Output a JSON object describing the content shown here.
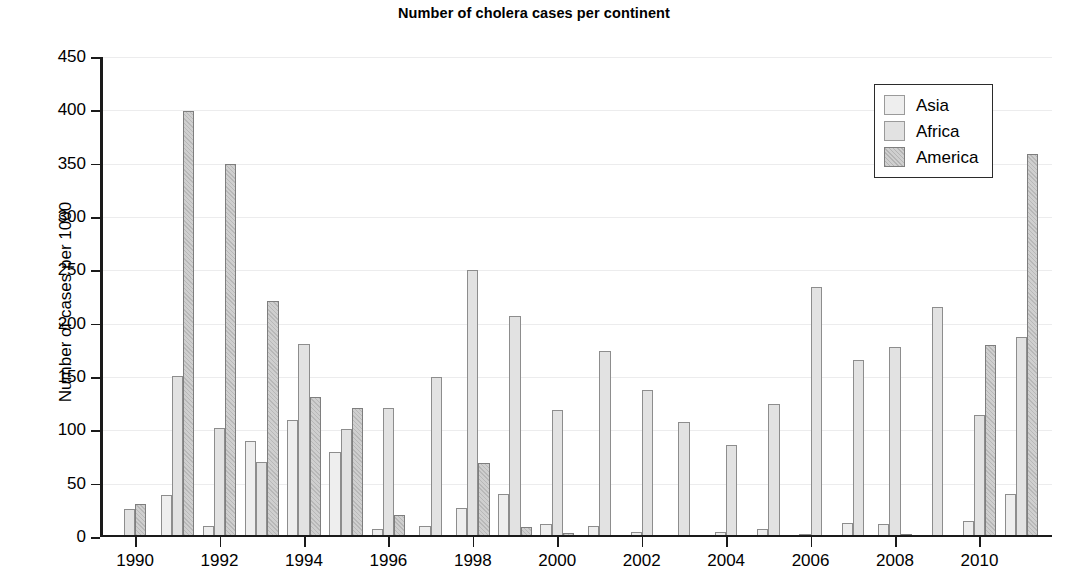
{
  "chart_data": {
    "type": "bar",
    "title": "Number of cholera cases per continent",
    "xlabel": "",
    "ylabel": "Number of cases per 1000",
    "ylim": [
      0,
      450
    ],
    "ytick_step": 50,
    "yticks": [
      0,
      50,
      100,
      150,
      200,
      250,
      300,
      350,
      400,
      450
    ],
    "xticks": [
      1990,
      1992,
      1994,
      1996,
      1998,
      2000,
      2002,
      2004,
      2006,
      2008,
      2010
    ],
    "x_range": [
      1990,
      2011
    ],
    "grid": true,
    "legend_position": "top-right",
    "categories": [
      1990,
      1991,
      1992,
      1993,
      1994,
      1995,
      1996,
      1997,
      1998,
      1999,
      2000,
      2001,
      2002,
      2003,
      2004,
      2005,
      2006,
      2007,
      2008,
      2009,
      2010,
      2011
    ],
    "series": [
      {
        "name": "Asia",
        "color": "#eeeeee",
        "values": [
          0,
          38,
          9,
          89,
          109,
          79,
          7,
          9,
          26,
          39,
          11,
          9,
          4,
          0,
          4,
          7,
          2,
          12,
          11,
          0,
          14,
          39
        ]
      },
      {
        "name": "Africa",
        "color": "#e2e2e2",
        "values": [
          25,
          150,
          101,
          69,
          180,
          100,
          120,
          149,
          249,
          206,
          118,
          173,
          137,
          107,
          85,
          124,
          233,
          165,
          177,
          215,
          113,
          187
        ]
      },
      {
        "name": "America",
        "color": "#cfcfcf",
        "values": [
          30,
          398,
          349,
          220,
          130,
          120,
          20,
          0,
          68,
          8,
          3,
          0,
          0,
          0,
          0,
          0,
          0,
          0,
          1,
          0,
          179,
          358
        ]
      }
    ]
  },
  "legend": {
    "entries": [
      {
        "label": "Asia"
      },
      {
        "label": "Africa"
      },
      {
        "label": "America"
      }
    ]
  }
}
